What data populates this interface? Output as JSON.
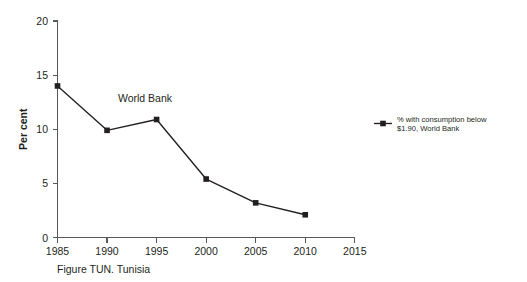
{
  "chart_data": {
    "type": "line",
    "title": "",
    "subtitle": "",
    "xlabel": "",
    "ylabel": "Per cent",
    "x": [
      1985,
      1990,
      1995,
      2000,
      2005,
      2010
    ],
    "xlim": [
      1985,
      2015
    ],
    "ylim": [
      0,
      20
    ],
    "xticks": [
      1985,
      1990,
      1995,
      2000,
      2005,
      2010,
      2015
    ],
    "xtick_labels": [
      "1985",
      "1990",
      "1995",
      "2000",
      "2005",
      "2010",
      "2015"
    ],
    "yticks": [
      0,
      5,
      10,
      15,
      20
    ],
    "ytick_labels": [
      "0",
      "5",
      "10",
      "15",
      "20"
    ],
    "grid": false,
    "legend_position": "right",
    "series": [
      {
        "name": "% with consumption below $1.90, World Bank",
        "values": [
          14.0,
          9.9,
          10.9,
          5.4,
          3.2,
          2.1
        ],
        "color": "#231f20",
        "marker": "square"
      }
    ],
    "annotations": [
      {
        "text": "World Bank",
        "x": 1991.1,
        "y": 12.5
      }
    ]
  },
  "legend": {
    "entries": [
      {
        "line1": "% with consumption below",
        "line2": "$1.90, World Bank"
      }
    ]
  },
  "axis": {
    "y_title": "Per cent"
  },
  "caption": {
    "text": "Figure TUN. Tunisia"
  }
}
